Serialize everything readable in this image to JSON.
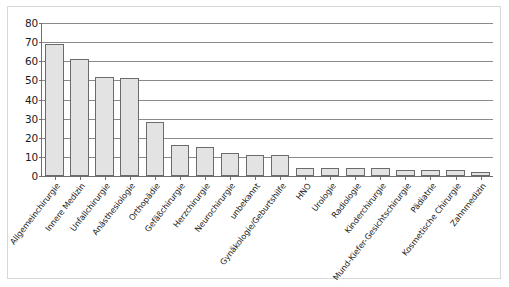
{
  "chart_data": {
    "type": "bar",
    "title": "",
    "subtitle": "",
    "xlabel": "",
    "ylabel": "",
    "ylim": [
      0,
      80
    ],
    "ytick_step": 10,
    "yticks": [
      0,
      10,
      20,
      30,
      40,
      50,
      60,
      70,
      80
    ],
    "grid": true,
    "legend": false,
    "legend_position": "none",
    "bar_fill_color": "#e3e3e3",
    "bar_edge_color": "#6b6b6b",
    "axis_color": "#6e6e6e",
    "gridline_color": "#8a8a8a",
    "frame_color": "#d8d8d8",
    "background_color": "#ffffff",
    "categories": [
      "Allgemeinchirurgie",
      "Innere Medizin",
      "Unfallchirurgie",
      "Anästhesiologie",
      "Orthopädie",
      "Gefäßchirurgie",
      "Herzchirurgie",
      "Neurochirurgie",
      "unbekannt",
      "Gynäkologie/Geburtshilfe",
      "HNO",
      "Urologie",
      "Radiologie",
      "Kinderchirurgie",
      "Mund-Kiefer-Gesichtschirurgie",
      "Pädiatrie",
      "Kosmetische Chirurgie",
      "Zahnmedizin"
    ],
    "values": [
      69,
      61,
      52,
      51,
      28,
      16,
      15,
      12,
      11,
      11,
      4,
      4,
      4,
      4,
      3,
      3,
      3,
      2
    ]
  }
}
